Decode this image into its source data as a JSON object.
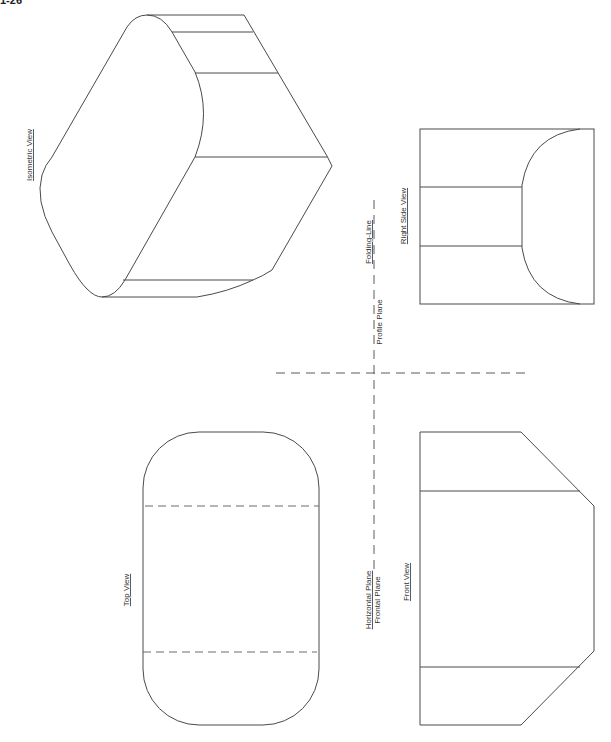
{
  "figure": {
    "number": "1-26"
  },
  "views": {
    "isometric": {
      "label": "Isometric View"
    },
    "top": {
      "label": "Top View"
    },
    "front": {
      "label": "Front View"
    },
    "right_side": {
      "label": "Right Side View"
    }
  },
  "folding_lines": {
    "folding_line_label": "Folding-Line",
    "profile_plane_label": "Profile Plane",
    "horizontal_plane_label": "Horizontal Plane",
    "frontal_plane_label": "Frontal Plane"
  },
  "colors": {
    "line": "#4a4a4a",
    "background": "#ffffff"
  }
}
